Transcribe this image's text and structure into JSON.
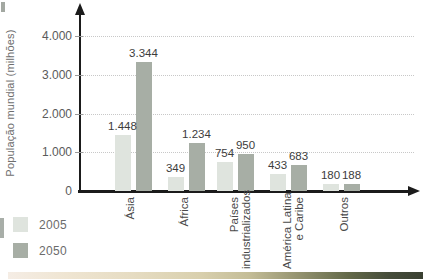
{
  "chart_data": {
    "type": "bar",
    "title": "",
    "ylabel": "População mundial (milhões)",
    "xlabel": "",
    "ylim": [
      0,
      4400
    ],
    "grid": "horizontal-dotted",
    "legend_position": "bottom-left",
    "yticks": [
      {
        "value": 0,
        "label": "0"
      },
      {
        "value": 1000,
        "label": "1.000"
      },
      {
        "value": 2000,
        "label": "2.000"
      },
      {
        "value": 3000,
        "label": "3.000"
      },
      {
        "value": 4000,
        "label": "4.000"
      }
    ],
    "categories": [
      {
        "lines": [
          "Ásia"
        ]
      },
      {
        "lines": [
          "África"
        ]
      },
      {
        "lines": [
          "Países",
          "industrializados"
        ]
      },
      {
        "lines": [
          "América Latina",
          "e Caribe"
        ]
      },
      {
        "lines": [
          "Outros"
        ]
      }
    ],
    "series": [
      {
        "name": "2005",
        "color": "#dfe4de",
        "values": [
          1448,
          349,
          754,
          433,
          180
        ],
        "labels": [
          "1.448",
          "349",
          "754",
          "433",
          "180"
        ]
      },
      {
        "name": "2050",
        "color": "#a7aea5",
        "values": [
          3344,
          1234,
          950,
          683,
          188
        ],
        "labels": [
          "3.344",
          "1.234",
          "950",
          "683",
          "188"
        ]
      }
    ]
  },
  "colors": {
    "axis": "#1b1b1b",
    "gridline": "#c8c8c8",
    "bar_2005": "#dfe4de",
    "bar_2050": "#a7aea5",
    "value_label": "#3c3c3c",
    "tick_label": "#5a5a5a",
    "category_label": "#4a4a4a",
    "legend_label": "#6b6b6b",
    "background": "#ffffff"
  }
}
